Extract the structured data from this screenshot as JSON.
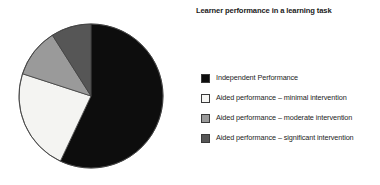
{
  "chart_data": {
    "type": "pie",
    "title": "Learner performance in a learning task",
    "xlabel": "",
    "ylabel": "",
    "legend_position": "right",
    "grid": false,
    "categories": [
      "Independent Performance",
      "Aided performance – minimal intervention",
      "Aided performance – moderate intervention",
      "Aided performance – significant intervention"
    ],
    "values": [
      57,
      23,
      11,
      9
    ],
    "colors": [
      "#0d0d0d",
      "#f2f2f0",
      "#9a9a9a",
      "#565656"
    ],
    "start_angle_deg": 0,
    "direction": "clockwise"
  },
  "title": "Learner performance in a learning task",
  "legend": {
    "items": [
      {
        "label": "Independent Performance",
        "color": "#0d0d0d",
        "swatch_name": "legend-swatch-independent-performance"
      },
      {
        "label": "Aided performance – minimal intervention",
        "color": "#f6f6f4",
        "swatch_name": "legend-swatch-minimal-intervention"
      },
      {
        "label": "Aided performance – moderate intervention",
        "color": "#9a9a9a",
        "swatch_name": "legend-swatch-moderate-intervention"
      },
      {
        "label": "Aided performance – significant intervention",
        "color": "#565656",
        "swatch_name": "legend-swatch-significant-intervention"
      }
    ]
  },
  "pie": {
    "slices": [
      {
        "name": "slice-independent-performance",
        "percent": 57,
        "color": "#0d0d0d"
      },
      {
        "name": "slice-minimal-intervention",
        "percent": 23,
        "color": "#f4f4f2"
      },
      {
        "name": "slice-moderate-intervention",
        "percent": 11,
        "color": "#9a9a9a"
      },
      {
        "name": "slice-significant-intervention",
        "percent": 9,
        "color": "#565656"
      }
    ]
  }
}
